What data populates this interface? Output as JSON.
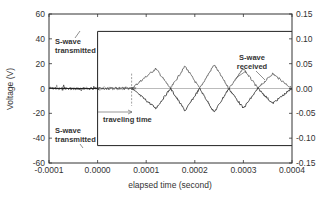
{
  "chart_data": {
    "type": "line",
    "title": "",
    "xlabel": "elapsed time (second)",
    "ylabel": "Voltage (V)",
    "y2label": "",
    "xlim": [
      -0.0001,
      0.0004
    ],
    "ylim": [
      -60,
      60
    ],
    "y2lim": [
      -0.15,
      0.15
    ],
    "x_ticks": [
      "-0.0001",
      "0.0000",
      "0.0001",
      "0.0002",
      "0.0003",
      "0.0004"
    ],
    "y_ticks": [
      "-60",
      "-40",
      "-20",
      "0",
      "20",
      "40",
      "60"
    ],
    "y2_ticks": [
      "-0.15",
      "-0.10",
      "-0.05",
      "0.00",
      "0.05",
      "0.10",
      "0.15"
    ],
    "grid": false,
    "legend": null,
    "series": [
      {
        "name": "S-wave transmitted (positive)",
        "axis": "left",
        "x": [
          -0.0001,
          0.0,
          0.0,
          0.0004
        ],
        "y": [
          0,
          0,
          46,
          46
        ]
      },
      {
        "name": "S-wave transmitted (negative)",
        "axis": "left",
        "x": [
          -0.0001,
          0.0,
          0.0,
          0.0004
        ],
        "y": [
          0,
          0,
          -46,
          -46
        ]
      },
      {
        "name": "S-wave received (trace A)",
        "axis": "right",
        "x": [
          -0.0001,
          7e-05,
          0.00012,
          0.00015,
          0.00018,
          0.00021,
          0.00024,
          0.00027,
          0.0003,
          0.00033,
          0.00036,
          0.0004
        ],
        "y": [
          0.0,
          0.0,
          0.04,
          0.0,
          0.045,
          0.0,
          0.048,
          0.0,
          0.04,
          0.0,
          0.03,
          0.0
        ]
      },
      {
        "name": "S-wave received (trace B)",
        "axis": "right",
        "x": [
          -0.0001,
          7e-05,
          0.00012,
          0.00015,
          0.00018,
          0.00021,
          0.00024,
          0.00027,
          0.0003,
          0.00033,
          0.00036,
          0.0004
        ],
        "y": [
          0.0,
          0.0,
          -0.04,
          0.0,
          -0.045,
          0.0,
          -0.048,
          0.0,
          -0.04,
          0.0,
          -0.03,
          0.0
        ]
      }
    ],
    "annotations": [
      {
        "text": "S-wave transmitted",
        "position": "upper-left",
        "target_y": 46
      },
      {
        "text": "S-wave transmitted",
        "position": "lower-left",
        "target_y": -46
      },
      {
        "text": "traveling time",
        "position": "center-left",
        "range_x": [
          0.0,
          7e-05
        ]
      },
      {
        "text": "S-wave received",
        "position": "upper-right"
      }
    ],
    "markers": [
      {
        "type": "vline",
        "x": 7e-05,
        "style": "dashed",
        "meaning": "arrival of S-wave"
      }
    ]
  },
  "labels": {
    "xlabel": "elapsed time (second)",
    "ylabel": "Voltage (V)",
    "annot_tx_top_1": "S-wave",
    "annot_tx_top_2": "transmitted",
    "annot_tx_bot_1": "S-wave",
    "annot_tx_bot_2": "transmitted",
    "annot_travel": "traveling time",
    "annot_rx_1": "S-wave",
    "annot_rx_2": "received"
  }
}
